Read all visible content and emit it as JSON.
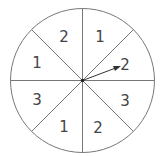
{
  "spinner": {
    "center": [
      82.5,
      80.5
    ],
    "radius": 72,
    "stroke_color": "#777777",
    "sectors": [
      {
        "label": "1",
        "position": "top-right"
      },
      {
        "label": "2",
        "position": "right-upper"
      },
      {
        "label": "3",
        "position": "right-lower"
      },
      {
        "label": "2",
        "position": "bottom-right"
      },
      {
        "label": "1",
        "position": "bottom-left"
      },
      {
        "label": "3",
        "position": "left-lower"
      },
      {
        "label": "1",
        "position": "left-upper"
      },
      {
        "label": "2",
        "position": "top-left"
      }
    ],
    "arrow": {
      "points_to": "2",
      "tip": [
        119,
        67
      ]
    }
  }
}
